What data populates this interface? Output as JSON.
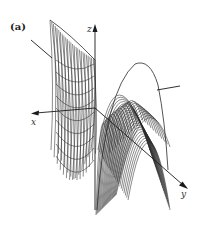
{
  "figure": {
    "panel_label": "(a)",
    "type": "3d-wireframe-surface",
    "axes": {
      "x_label": "x",
      "y_label": "y",
      "z_label": "z"
    },
    "colors": {
      "mesh": "#2a2a2a",
      "axis": "#1a1a1a",
      "background": "#ffffff"
    }
  }
}
